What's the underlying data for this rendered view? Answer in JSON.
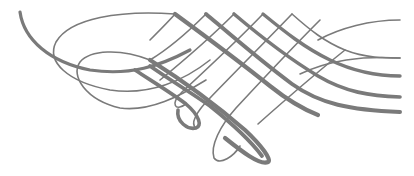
{
  "artwork": {
    "title": "Calligraphic lattice flourish",
    "color": "#7a7a7a",
    "background": "#ffffff",
    "width": 414,
    "height": 176
  },
  "paths": [
    {
      "name": "left-sweep-thick",
      "width": 3.2,
      "d": "M20 12 C24 40 50 62 90 70 C130 76 160 66 190 50"
    },
    {
      "name": "outer-left-loop",
      "width": 1.6,
      "d": "M175 14 C120 10 70 18 56 42 C46 62 68 82 110 90 C150 96 185 80 210 60"
    },
    {
      "name": "inner-left-loop",
      "width": 1.6,
      "d": "M150 60 C120 48 90 50 80 62 C70 76 86 100 120 108 C150 112 180 96 206 80"
    },
    {
      "name": "diag-thick-1",
      "width": 4.2,
      "d": "M175 14 C205 36 240 62 270 86 C285 98 300 108 318 115"
    },
    {
      "name": "diag-thick-2",
      "width": 4.2,
      "d": "M150 60 C185 82 215 104 245 130 C262 146 272 160 268 162 C260 166 240 150 225 138"
    },
    {
      "name": "diag-thick-3",
      "width": 4.0,
      "d": "M206 14 C232 36 262 62 292 84 C320 104 350 110 400 112"
    },
    {
      "name": "diag-thick-4",
      "width": 3.6,
      "d": "M234 14 C260 36 288 58 318 76 C345 92 370 96 400 97"
    },
    {
      "name": "diag-thick-5",
      "width": 3.4,
      "d": "M263 14 C285 32 305 48 330 60 C355 72 380 76 400 76"
    },
    {
      "name": "diag-thin-6",
      "width": 1.6,
      "d": "M292 14 C310 30 325 42 345 50 C365 58 385 58 400 58"
    },
    {
      "name": "diag-thick-7",
      "width": 3.8,
      "d": "M150 66 C170 80 190 92 210 106 C230 122 250 140 262 156"
    },
    {
      "name": "diag-thick-8",
      "width": 3.6,
      "d": "M135 70 C150 80 170 92 186 104 C200 116 202 126 196 128 C188 130 176 122 178 110"
    },
    {
      "name": "cross-thin-1",
      "width": 1.6,
      "d": "M175 14 C170 20 160 30 150 40"
    },
    {
      "name": "cross-thin-2",
      "width": 1.6,
      "d": "M206 14 C190 30 170 48 150 60"
    },
    {
      "name": "cross-thin-3",
      "width": 1.6,
      "d": "M234 14 C210 38 182 62 160 80"
    },
    {
      "name": "cross-thin-4",
      "width": 1.6,
      "d": "M263 14 C238 40 208 68 182 92 C170 104 175 112 186 104"
    },
    {
      "name": "cross-thin-5",
      "width": 1.6,
      "d": "M292 14 C265 42 235 72 210 98 C196 112 190 124 196 128"
    },
    {
      "name": "cross-thin-6",
      "width": 1.6,
      "d": "M320 20 C292 48 262 80 236 108 C220 126 210 146 214 158 C220 166 234 156 240 146"
    },
    {
      "name": "cross-thin-7",
      "width": 1.6,
      "d": "M345 50 C315 74 285 100 258 124"
    },
    {
      "name": "right-thin-upper",
      "width": 1.6,
      "d": "M318 40 C340 28 370 20 400 20"
    },
    {
      "name": "right-thin-lower",
      "width": 1.6,
      "d": "M300 74 C330 60 360 56 400 58"
    }
  ]
}
